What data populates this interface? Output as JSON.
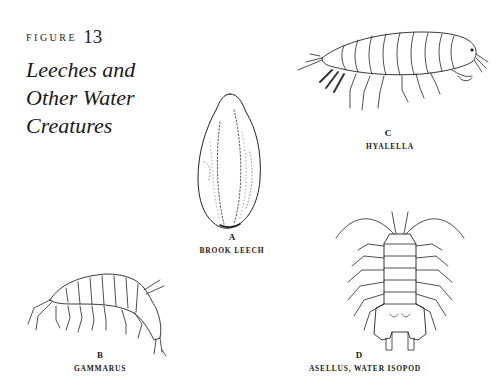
{
  "figure": {
    "label": "FIGURE",
    "number": "13",
    "title_lines": [
      "Leeches and",
      "Other Water",
      "Creatures"
    ]
  },
  "illustrations": [
    {
      "letter": "A",
      "caption": "BROOK LEECH",
      "icon": "brook-leech-illustration"
    },
    {
      "letter": "B",
      "caption": "GAMMARUS",
      "icon": "gammarus-illustration"
    },
    {
      "letter": "C",
      "caption": "HYALELLA",
      "icon": "hyalella-illustration"
    },
    {
      "letter": "D",
      "caption": "ASELLUS, WATER ISOPOD",
      "icon": "asellus-illustration"
    }
  ]
}
